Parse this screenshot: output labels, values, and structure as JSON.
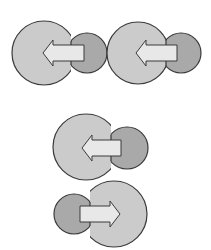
{
  "diagram": {
    "width": 211,
    "height": 250,
    "colors": {
      "background": "#ffffff",
      "light_circle": "#cbcbcb",
      "dark_circle": "#a9a9a9",
      "arrow_fill": "#e8e8e8",
      "stroke": "#3a3a3a"
    },
    "figures": [
      {
        "name": "figure-1-arrow-left",
        "direction": "left",
        "big_circle": {
          "cx": 44,
          "cy": 53,
          "r": 32
        },
        "small_circle": {
          "cx": 87,
          "cy": 53,
          "r": 20,
          "seam_x": 71
        },
        "arrow": {
          "tip_x": 43,
          "head_base_x": 53,
          "tail_x": 84,
          "cy": 53,
          "shaft_half": 8,
          "head_half": 13
        }
      },
      {
        "name": "figure-2-arrow-left",
        "direction": "left",
        "big_circle": {
          "cx": 138,
          "cy": 53,
          "r": 31
        },
        "small_circle": {
          "cx": 181,
          "cy": 53,
          "r": 20,
          "seam_x": 166
        },
        "arrow": {
          "tip_x": 136,
          "head_base_x": 146,
          "tail_x": 177,
          "cy": 53,
          "shaft_half": 8,
          "head_half": 13
        }
      },
      {
        "name": "figure-3-arrow-left",
        "direction": "left",
        "big_circle": {
          "cx": 86,
          "cy": 147,
          "r": 33
        },
        "small_circle": {
          "cx": 127,
          "cy": 148,
          "r": 21,
          "seam_x": 111
        },
        "arrow": {
          "tip_x": 82,
          "head_base_x": 92,
          "tail_x": 121,
          "cy": 148,
          "shaft_half": 8,
          "head_half": 13
        }
      },
      {
        "name": "figure-4-arrow-right",
        "direction": "right",
        "big_circle": {
          "cx": 114,
          "cy": 214,
          "r": 33
        },
        "small_circle": {
          "cx": 74,
          "cy": 214,
          "r": 20,
          "seam_x": 90
        },
        "arrow": {
          "tip_x": 120,
          "head_base_x": 110,
          "tail_x": 80,
          "cy": 214,
          "shaft_half": 8,
          "head_half": 13
        }
      }
    ]
  }
}
